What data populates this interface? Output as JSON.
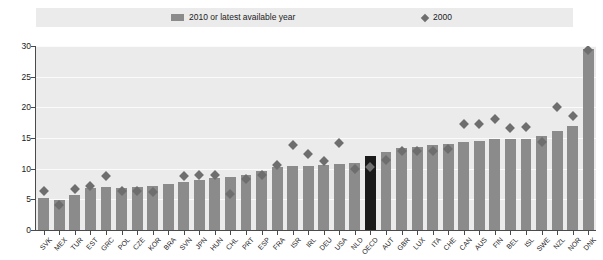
{
  "legend": {
    "entries": [
      {
        "label": "2010 or latest available year",
        "icon": "bar-swatch",
        "color": "#8b8b8b"
      },
      {
        "label": "2000",
        "icon": "diamond-marker",
        "color": "#6e6e6e"
      }
    ]
  },
  "axis": {
    "y_ticks": [
      "0",
      "5",
      "10",
      "15",
      "20",
      "25",
      "30"
    ]
  },
  "colors": {
    "bar": "#8b8b8b",
    "bar_highlight": "#1a1a1a",
    "marker": "#6e6e6e",
    "plot_background": "#ebebeb",
    "gridline": "#fbfbfb"
  },
  "chart_data": {
    "type": "bar",
    "title": "",
    "subtitle": "",
    "xlabel": "",
    "ylabel": "",
    "ylim": [
      0,
      30
    ],
    "yticks": [
      0,
      5,
      10,
      15,
      20,
      25,
      30
    ],
    "grid": true,
    "legend_position": "top",
    "highlight_category": "OECD",
    "categories": [
      "SVK",
      "MEX",
      "TUR",
      "EST",
      "GRC",
      "POL",
      "CZE",
      "KOR",
      "BRA",
      "SVN",
      "JPN",
      "HUN",
      "CHL",
      "PRT",
      "ESP",
      "FRA",
      "ISR",
      "IRL",
      "DEU",
      "USA",
      "NLD",
      "OECD",
      "AUT",
      "GBR",
      "LUX",
      "ITA",
      "CHE",
      "CAN",
      "AUS",
      "FIN",
      "BEL",
      "ISL",
      "SWE",
      "NZL",
      "NOR",
      "DNK"
    ],
    "series": [
      {
        "name": "2010 or latest available year",
        "type": "bar",
        "values": [
          5.2,
          4.9,
          5.7,
          6.9,
          7.0,
          6.9,
          7.0,
          7.1,
          7.5,
          7.9,
          8.2,
          8.5,
          8.6,
          9.0,
          9.6,
          10.2,
          10.4,
          10.5,
          10.6,
          10.7,
          10.9,
          12.1,
          12.8,
          13.3,
          13.5,
          13.8,
          14.1,
          14.4,
          14.5,
          14.8,
          14.9,
          14.8,
          15.3,
          16.2,
          17.0,
          29.5
        ]
      },
      {
        "name": "2000",
        "type": "scatter",
        "marker": "diamond",
        "values": [
          7.0,
          4.7,
          7.2,
          7.8,
          9.4,
          6.9,
          7.0,
          6.8,
          null,
          9.4,
          9.5,
          9.5,
          6.5,
          8.9,
          9.5,
          11.2,
          14.5,
          13.0,
          11.8,
          14.8,
          10.6,
          10.9,
          12.0,
          13.5,
          13.5,
          13.4,
          13.8,
          17.8,
          17.8,
          18.7,
          17.2,
          17.4,
          15.0,
          20.7,
          19.2,
          30.0
        ]
      }
    ]
  }
}
